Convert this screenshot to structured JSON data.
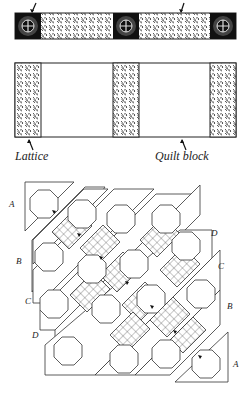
{
  "top_strip": {
    "description": "Lattice strip with corner squares",
    "arrows": [
      {
        "x": 33,
        "y": 2
      },
      {
        "x": 182,
        "y": 2
      }
    ]
  },
  "middle_panel": {
    "labels": {
      "lattice": "Lattice",
      "quilt_block": "Quilt block"
    }
  },
  "diagonal_layout": {
    "row_labels_left": [
      "A",
      "B",
      "C",
      "D"
    ],
    "row_labels_right": [
      "D",
      "C",
      "B",
      "A"
    ]
  },
  "colors": {
    "line": "#222222",
    "fill_pattern": "#333333",
    "background": "#ffffff"
  }
}
